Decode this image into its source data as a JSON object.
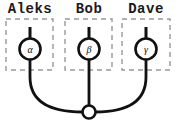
{
  "diagram": {
    "type": "merge-diagram",
    "colors": {
      "line": "#111111",
      "dashed_box": "#999999",
      "background": "#ffffff",
      "node_fill": "#ffffff"
    },
    "participants": [
      {
        "label": "Aleks",
        "symbol": "α"
      },
      {
        "label": "Bob",
        "symbol": "β"
      },
      {
        "label": "Dave",
        "symbol": "γ"
      }
    ],
    "junction": {
      "shape": "open-circle"
    }
  }
}
